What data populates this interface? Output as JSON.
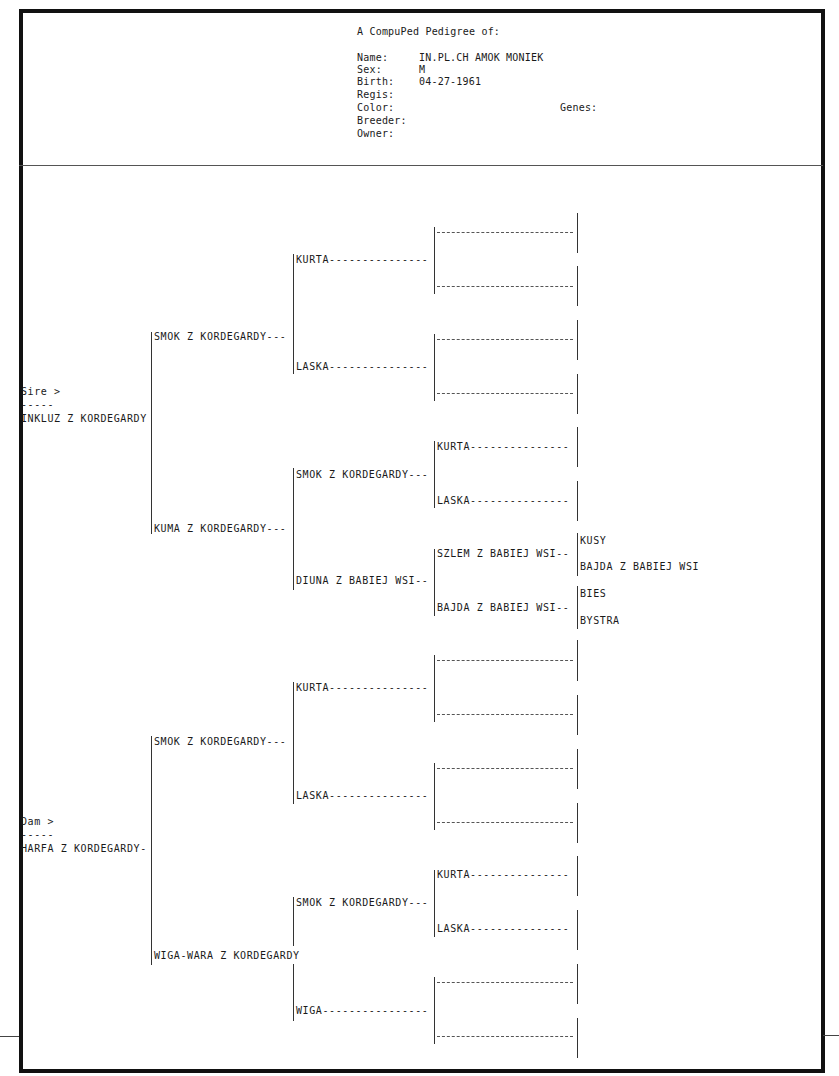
{
  "header": {
    "title": "A CompuPed Pedigree of:",
    "fields": [
      {
        "label": "Name:",
        "value": "IN.PL.CH AMOK MONIEK"
      },
      {
        "label": "Sex:",
        "value": "M"
      },
      {
        "label": "Birth:",
        "value": "04-27-1961"
      },
      {
        "label": "Regis:",
        "value": ""
      },
      {
        "label": "Color:",
        "value": ""
      },
      {
        "label": "Breeder:",
        "value": ""
      },
      {
        "label": "Owner:",
        "value": ""
      }
    ],
    "genes_label": "Genes:"
  },
  "pedigree": {
    "sire_marker": "Sire >",
    "dam_marker": "Dam >",
    "marker_rule": "-----",
    "sire": {
      "name": "INKLUZ Z KORDEGARDY",
      "sire": {
        "name": "SMOK Z KORDEGARDY---",
        "sire": {
          "name": "KURTA---------------"
        },
        "dam": {
          "name": "LASKA---------------"
        }
      },
      "dam": {
        "name": "KUMA Z KORDEGARDY---",
        "sire": {
          "name": "SMOK Z KORDEGARDY---",
          "sire": {
            "name": "KURTA---------------"
          },
          "dam": {
            "name": "LASKA---------------"
          }
        },
        "dam": {
          "name": "DIUNA Z BABIEJ WSI--",
          "sire": {
            "name": "SZLEM Z BABIEJ WSI--",
            "sire": {
              "name": "KUSY"
            },
            "dam": {
              "name": "BAJDA Z BABIEJ WSI"
            }
          },
          "dam": {
            "name": "BAJDA Z BABIEJ WSI--",
            "sire": {
              "name": "BIES"
            },
            "dam": {
              "name": "BYSTRA"
            }
          }
        }
      }
    },
    "dam": {
      "name": "HARFA Z KORDEGARDY-",
      "sire": {
        "name": "SMOK Z KORDEGARDY---",
        "sire": {
          "name": "KURTA---------------"
        },
        "dam": {
          "name": "LASKA---------------"
        }
      },
      "dam": {
        "name": "WIGA-WARA Z KORDEGARDY",
        "sire": {
          "name": "SMOK Z KORDEGARDY---",
          "sire": {
            "name": "KURTA---------------"
          },
          "dam": {
            "name": "LASKA---------------"
          }
        },
        "dam": {
          "name": "WIGA----------------"
        }
      }
    }
  }
}
